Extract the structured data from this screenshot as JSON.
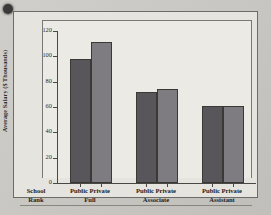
{
  "chart_data": {
    "type": "bar",
    "title": "",
    "xlabel": "",
    "ylabel": "Average Salary ($ Thousands)",
    "ylim": [
      0,
      120
    ],
    "yticks": [
      0,
      20,
      40,
      60,
      80,
      100,
      120
    ],
    "ytick_labels": [
      "0",
      "20",
      "40",
      "60",
      "80",
      "100",
      "120"
    ],
    "grid": false,
    "legend": "none",
    "row_header": {
      "line1": "School",
      "line2": "Rank"
    },
    "categories": [
      "Full",
      "Associate",
      "Assistant"
    ],
    "series": [
      {
        "name": "Public",
        "values": [
          98,
          72,
          61
        ]
      },
      {
        "name": "Private",
        "values": [
          111,
          74,
          61
        ]
      }
    ],
    "groups": [
      {
        "rank": "Full",
        "bars": [
          {
            "sector": "Public",
            "value": 98
          },
          {
            "sector": "Private",
            "value": 111
          }
        ]
      },
      {
        "rank": "Associate",
        "bars": [
          {
            "sector": "Public",
            "value": 72
          },
          {
            "sector": "Private",
            "value": 74
          }
        ]
      },
      {
        "rank": "Assistant",
        "bars": [
          {
            "sector": "Public",
            "value": 61
          },
          {
            "sector": "Private",
            "value": 61
          }
        ]
      }
    ],
    "colors": {
      "public": "#58565a",
      "private": "#7e7c80",
      "axis": "#4a4845",
      "plot_background": "#eceae5",
      "frame_background": "#e6e4df",
      "page_background": "#cbc9c4"
    }
  }
}
